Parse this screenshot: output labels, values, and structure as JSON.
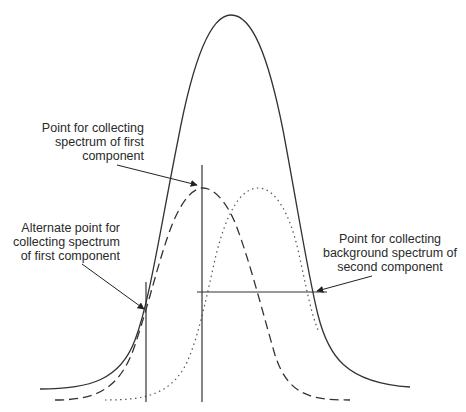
{
  "diagram": {
    "title": "",
    "colors": {
      "line": "#333333",
      "background": "#ffffff"
    },
    "curves": [
      {
        "name": "total-signal",
        "style": "solid",
        "peak": [
          231,
          15
        ]
      },
      {
        "name": "first-component",
        "style": "dashed",
        "peak": [
          203,
          188
        ]
      },
      {
        "name": "second-component",
        "style": "dotted",
        "peak": [
          258,
          188
        ]
      }
    ],
    "annotations": {
      "first_point": {
        "lines": [
          "Point for collecting",
          "spectrum of first",
          "component"
        ]
      },
      "alternate_point": {
        "lines": [
          "Alternate point for",
          "collecting spectrum",
          "of first component"
        ]
      },
      "background_point": {
        "lines": [
          "Point for collecting",
          "background spectrum of",
          "second component"
        ]
      }
    }
  }
}
